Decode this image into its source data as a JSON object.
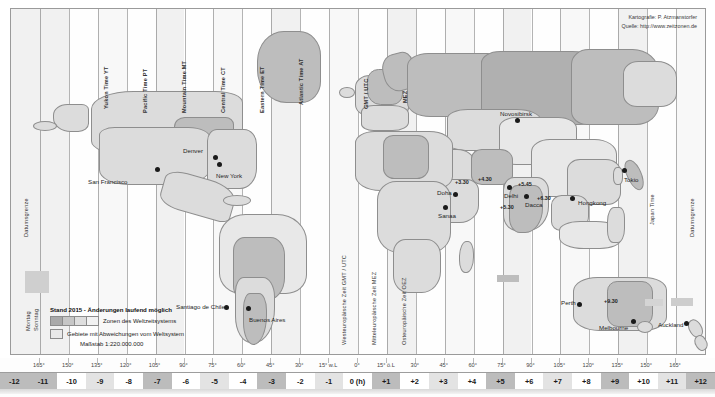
{
  "meta": {
    "credit_line_1": "Kartografie: P. Atzmanstorfer",
    "credit_line_2": "Quelle: http://www.zeitzonen.de"
  },
  "legend": {
    "heading": "Stand 2015 - Änderungen laufend möglich",
    "item_zones": "Zonen des Weltzeitsystems",
    "item_deviations": "Gebiete mit Abweichungen vom Weltsystem",
    "scale": "Maßstab 1:220.000.000"
  },
  "edge_labels": {
    "dateline_left": "Datumsgrenze",
    "dateline_right": "Datumsgrenze",
    "monday": "Montag",
    "sunday": "Sonntag"
  },
  "zone_labels_top": [
    "Yukon Time YT",
    "Pacific Time PT",
    "Mountain Time MT",
    "Central Time CT",
    "Eastern Time ET",
    "Atlantic Time AT",
    "GMT / UTC",
    "MEZ"
  ],
  "zone_labels_mid": [
    "Westeuropäische Zeit GMT / UTC",
    "Mitteleuropäische Zeit MEZ",
    "Osteuropäische Zeit OEZ"
  ],
  "zone_labels_right": [
    "Japan Time"
  ],
  "cities": [
    {
      "name": "San Francisco",
      "x": 88,
      "y": 178,
      "dot_x": 155,
      "dot_y": 167,
      "align": "left"
    },
    {
      "name": "Denver",
      "x": 183,
      "y": 147,
      "dot_x": 213,
      "dot_y": 155,
      "align": "left"
    },
    {
      "name": "New York",
      "x": 216,
      "y": 172,
      "dot_x": 217,
      "dot_y": 162,
      "align": "left"
    },
    {
      "name": "Santiago de Chile",
      "x": 176,
      "y": 303,
      "dot_x": 224,
      "dot_y": 305,
      "align": "left"
    },
    {
      "name": "Buenos Aires",
      "x": 249,
      "y": 316,
      "dot_x": 246,
      "dot_y": 306,
      "align": "left"
    },
    {
      "name": "Novosibirsk",
      "x": 500,
      "y": 110,
      "dot_x": 515,
      "dot_y": 118,
      "align": "left"
    },
    {
      "name": "Doha",
      "x": 437,
      "y": 189,
      "dot_x": 453,
      "dot_y": 192,
      "align": "left"
    },
    {
      "name": "Sanaa",
      "x": 438,
      "y": 212,
      "dot_x": 443,
      "dot_y": 205,
      "align": "left"
    },
    {
      "name": "Delhi",
      "x": 504,
      "y": 192,
      "dot_x": 507,
      "dot_y": 185,
      "align": "left"
    },
    {
      "name": "Dacca",
      "x": 525,
      "y": 201,
      "dot_x": 524,
      "dot_y": 194,
      "align": "left"
    },
    {
      "name": "Hongkong",
      "x": 578,
      "y": 199,
      "dot_x": 570,
      "dot_y": 196,
      "align": "left"
    },
    {
      "name": "Tokio",
      "x": 624,
      "y": 176,
      "dot_x": 622,
      "dot_y": 168,
      "align": "left"
    },
    {
      "name": "Perth",
      "x": 561,
      "y": 299,
      "dot_x": 577,
      "dot_y": 302,
      "align": "left"
    },
    {
      "name": "Melbourne",
      "x": 599,
      "y": 324,
      "dot_x": 631,
      "dot_y": 319,
      "align": "left"
    },
    {
      "name": "Auckland",
      "x": 658,
      "y": 321,
      "dot_x": 684,
      "dot_y": 321,
      "align": "left"
    }
  ],
  "offsets": [
    {
      "label": "+3.30",
      "x": 455,
      "y": 179
    },
    {
      "label": "+4.30",
      "x": 478,
      "y": 176
    },
    {
      "label": "+5.45",
      "x": 518,
      "y": 181
    },
    {
      "label": "+5.30",
      "x": 500,
      "y": 204
    },
    {
      "label": "+6.30",
      "x": 537,
      "y": 195
    },
    {
      "label": "+9.30",
      "x": 604,
      "y": 298
    }
  ],
  "degree_scale": {
    "unit": "°",
    "labels": [
      "165°",
      "150°",
      "135°",
      "120°",
      "105°",
      "90°",
      "75°",
      "60°",
      "45°",
      "30°",
      "15° w.L",
      "0°",
      "15° ö.L",
      "30°",
      "45°",
      "60°",
      "75°",
      "90°",
      "105°",
      "120°",
      "135°",
      "150°",
      "165°"
    ]
  },
  "hour_scale": {
    "unit": "(h)",
    "labels": [
      "-12",
      "-11",
      "-10",
      "-9",
      "-8",
      "-7",
      "-6",
      "-5",
      "-4",
      "-3",
      "-2",
      "-1",
      "0 (h)",
      "+1",
      "+2",
      "+3",
      "+4",
      "+5",
      "+6",
      "+7",
      "+8",
      "+9",
      "+10",
      "+11",
      "+12"
    ],
    "shading": [
      "c",
      "c",
      "a",
      "b",
      "a",
      "c",
      "a",
      "b",
      "a",
      "c",
      "a",
      "b",
      "a",
      "c",
      "a",
      "b",
      "a",
      "c",
      "a",
      "b",
      "a",
      "c",
      "a",
      "b",
      "c"
    ]
  },
  "colors": {
    "zone_light": "#f2f2f2",
    "zone_mid": "#dedede",
    "zone_dark": "#bcbcbc",
    "land": "#dcdcdc",
    "land_dark": "#bdbdbd",
    "outline": "#8e8e8e",
    "text": "#222222"
  }
}
